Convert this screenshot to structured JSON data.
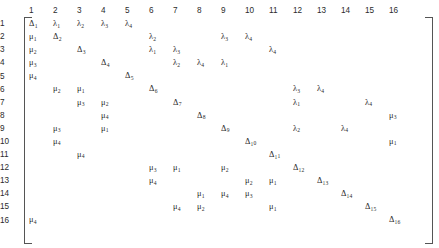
{
  "figure": {
    "kind": "matrix",
    "rows": 16,
    "cols": 16,
    "bracket_color": "#555555",
    "text_color": "#2b2b2b",
    "header_color": "#3a3a3a"
  },
  "col_headers": [
    "1",
    "2",
    "3",
    "4",
    "5",
    "6",
    "7",
    "8",
    "9",
    "10",
    "11",
    "12",
    "13",
    "14",
    "15",
    "16"
  ],
  "row_headers": [
    "1",
    "2",
    "3",
    "4",
    "5",
    "6",
    "7",
    "8",
    "9",
    "10",
    "11",
    "12",
    "13",
    "14",
    "15",
    "16"
  ],
  "cells": [
    [
      "Δ₁",
      "λ₁",
      "λ₂",
      "λ₃",
      "λ₄",
      "",
      "",
      "",
      "",
      "",
      "",
      "",
      "",
      "",
      "",
      ""
    ],
    [
      "μ₁",
      "Δ₂",
      "",
      "",
      "",
      "λ₂",
      "",
      "",
      "λ₃",
      "λ₄",
      "",
      "",
      "",
      "",
      "",
      ""
    ],
    [
      "μ₂",
      "",
      "Δ₃",
      "",
      "",
      "λ₁",
      "λ₃",
      "",
      "",
      "",
      "λ₄",
      "",
      "",
      "",
      "",
      ""
    ],
    [
      "μ₃",
      "",
      "",
      "Δ₄",
      "",
      "",
      "λ₂",
      "λ₄",
      "λ₁",
      "",
      "",
      "",
      "",
      "",
      "",
      ""
    ],
    [
      "μ₄",
      "",
      "",
      "",
      "Δ₅",
      "",
      "",
      "",
      "",
      "",
      "",
      "",
      "",
      "",
      "",
      ""
    ],
    [
      "",
      "μ₂",
      "μ₁",
      "",
      "",
      "Δ₆",
      "",
      "",
      "",
      "",
      "",
      "λ₃",
      "λ₄",
      "",
      "",
      ""
    ],
    [
      "",
      "",
      "μ₃",
      "μ₂",
      "",
      "",
      "Δ₇",
      "",
      "",
      "",
      "",
      "λ₁",
      "",
      "",
      "λ₄",
      ""
    ],
    [
      "",
      "",
      "",
      "μ₄",
      "",
      "",
      "",
      "Δ₈",
      "",
      "",
      "",
      "",
      "",
      "",
      "",
      "μ₃"
    ],
    [
      "",
      "μ₃",
      "",
      "μ₁",
      "",
      "",
      "",
      "",
      "Δ₉",
      "",
      "",
      "λ₂",
      "",
      "λ₄",
      "",
      ""
    ],
    [
      "",
      "μ₄",
      "",
      "",
      "",
      "",
      "",
      "",
      "",
      "Δ₁₀",
      "",
      "",
      "",
      "",
      "",
      "μ₁"
    ],
    [
      "",
      "",
      "μ₄",
      "",
      "",
      "",
      "",
      "",
      "",
      "",
      "Δ₁₁",
      "",
      "",
      "",
      "",
      ""
    ],
    [
      "",
      "",
      "",
      "",
      "",
      "μ₃",
      "μ₁",
      "",
      "μ₂",
      "",
      "",
      "Δ₁₂",
      "",
      "",
      "",
      ""
    ],
    [
      "",
      "",
      "",
      "",
      "",
      "μ₄",
      "",
      "",
      "",
      "μ₂",
      "μ₁",
      "",
      "Δ₁₃",
      "",
      "",
      ""
    ],
    [
      "",
      "",
      "",
      "",
      "",
      "",
      "",
      "μ₁",
      "μ₄",
      "μ₃",
      "",
      "",
      "",
      "Δ₁₄",
      "",
      ""
    ],
    [
      "",
      "",
      "",
      "",
      "",
      "",
      "μ₄",
      "μ₂",
      "",
      "",
      "μ₁",
      "",
      "",
      "",
      "Δ₁₅",
      ""
    ],
    [
      "μ₄",
      "",
      "",
      "",
      "",
      "",
      "",
      "",
      "",
      "",
      "",
      "",
      "",
      "",
      "",
      "Δ₁₆"
    ]
  ]
}
